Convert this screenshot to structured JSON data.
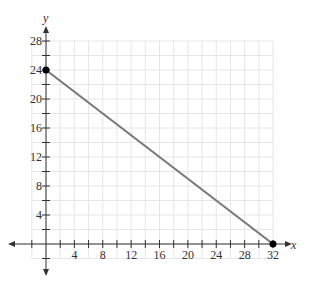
{
  "chart_data": {
    "type": "line",
    "title": "",
    "xlabel": "x",
    "ylabel": "y",
    "xlim": [
      -2,
      32
    ],
    "ylim": [
      -2,
      28
    ],
    "grid": true,
    "grid_step": 2,
    "xticks": [
      4,
      8,
      12,
      16,
      20,
      24,
      28,
      32
    ],
    "yticks": [
      4,
      8,
      12,
      16,
      20,
      24,
      28
    ],
    "series": [
      {
        "name": "line",
        "x": [
          0,
          32
        ],
        "y": [
          24,
          0
        ],
        "color": "#777777",
        "endpoints_marked": true
      }
    ],
    "points": [
      {
        "x": 0,
        "y": 24
      },
      {
        "x": 32,
        "y": 0
      }
    ]
  },
  "colors": {
    "grid": "#e6e6e6",
    "axis": "#333333",
    "line": "#7a7a7a",
    "point": "#000000"
  }
}
